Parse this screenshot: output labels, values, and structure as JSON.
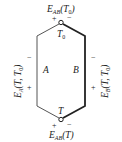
{
  "diagram": {
    "type": "thermocouple-circuit",
    "junctions": {
      "top": {
        "label": "T",
        "sub": "0",
        "emf_label": "E",
        "emf_sub": "AB",
        "emf_arg": "(T",
        "emf_arg_sub": "0",
        "emf_arg_end": ")",
        "plus": "+",
        "minus": "−"
      },
      "bottom": {
        "label": "T",
        "emf_label": "E",
        "emf_sub": "AB",
        "emf_arg": "(T)",
        "plus": "+",
        "minus": "−"
      }
    },
    "conductors": {
      "left": {
        "label": "A",
        "emf_label": "E",
        "emf_sub": "A",
        "emf_arg": "(T, T",
        "emf_arg_sub": "0",
        "emf_arg_end": ")",
        "top_sign": "−",
        "bottom_sign": "+"
      },
      "right": {
        "label": "B",
        "emf_label": "E",
        "emf_sub": "B",
        "emf_arg": "(T, T",
        "emf_arg_sub": "0",
        "emf_arg_end": ")",
        "top_sign": "−",
        "bottom_sign": "+"
      }
    },
    "colors": {
      "line": "#3a3a3a",
      "text": "#222222",
      "background": "#ffffff"
    }
  }
}
